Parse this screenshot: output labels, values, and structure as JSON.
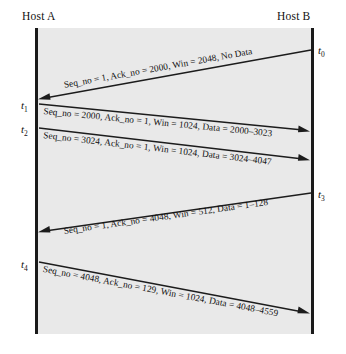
{
  "diagram": {
    "hosts": {
      "left_label": "Host A",
      "right_label": "Host B"
    },
    "time_marks": [
      {
        "id": "t0",
        "base": "t",
        "sub": "0",
        "side": "right"
      },
      {
        "id": "t1",
        "base": "t",
        "sub": "1",
        "side": "left"
      },
      {
        "id": "t2",
        "base": "t",
        "sub": "2",
        "side": "left"
      },
      {
        "id": "t3",
        "base": "t",
        "sub": "3",
        "side": "right"
      },
      {
        "id": "t4",
        "base": "t",
        "sub": "4",
        "side": "left"
      }
    ],
    "messages": [
      {
        "index": 1,
        "direction": "B-to-A",
        "label": "Seq_no = 1, Ack_no = 2000, Win = 2048, No Data",
        "seq_no": 1,
        "ack_no": 2000,
        "win": 2048,
        "data": "No Data",
        "from_time": "t0"
      },
      {
        "index": 2,
        "direction": "A-to-B",
        "label": "Seq_no = 2000, Ack_no = 1, Win = 1024, Data = 2000–3023",
        "seq_no": 2000,
        "ack_no": 1,
        "win": 1024,
        "data": "2000–3023",
        "from_time": "t1"
      },
      {
        "index": 3,
        "direction": "A-to-B",
        "label": "Seq_no = 3024, Ack_no = 1, Win = 1024, Data = 3024–4047",
        "seq_no": 3024,
        "ack_no": 1,
        "win": 1024,
        "data": "3024–4047",
        "from_time": "t2"
      },
      {
        "index": 4,
        "direction": "B-to-A",
        "label": "Seq_no = 1, Ack_no = 4048, Win = 512, Data = 1–128",
        "seq_no": 1,
        "ack_no": 4048,
        "win": 512,
        "data": "1–128",
        "from_time": "t3"
      },
      {
        "index": 5,
        "direction": "A-to-B",
        "label": "Seq_no = 4048, Ack_no = 129, Win = 1024, Data = 4048–4559",
        "seq_no": 4048,
        "ack_no": 129,
        "win": 1024,
        "data": "4048–4559",
        "from_time": "t4"
      }
    ],
    "colors": {
      "background": "#ffffff",
      "panel": "#e9e9e9",
      "line": "#1c1c1c",
      "text": "#111111"
    }
  }
}
